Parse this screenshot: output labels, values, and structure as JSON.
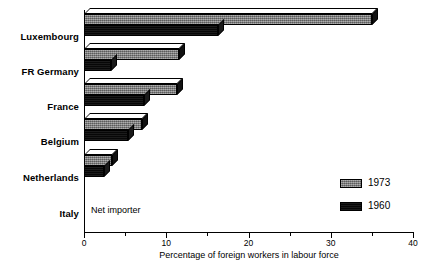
{
  "chart_data": {
    "type": "bar",
    "orientation": "horizontal",
    "title": "",
    "xlabel": "Percentage of foreign workers in labour force",
    "ylabel": "",
    "xlim": [
      0,
      40
    ],
    "grid": false,
    "legend_position": "bottom-right",
    "categories": [
      "Luxembourg",
      "FR Germany",
      "France",
      "Belgium",
      "Netherlands",
      "Italy"
    ],
    "series": [
      {
        "name": "1973",
        "color": "#828282",
        "values": [
          35.0,
          11.5,
          11.3,
          7.0,
          3.4,
          null
        ]
      },
      {
        "name": "1960",
        "color": "#0a0a0a",
        "values": [
          16.3,
          3.3,
          7.3,
          5.3,
          2.4,
          null
        ]
      }
    ],
    "annotations": [
      {
        "category": "Italy",
        "text": "Net importer"
      }
    ],
    "xticks": [
      {
        "value": 0,
        "label": "0",
        "major": true
      },
      {
        "value": 5,
        "label": "",
        "major": false
      },
      {
        "value": 10,
        "label": "10",
        "major": true
      },
      {
        "value": 15,
        "label": "",
        "major": false
      },
      {
        "value": 20,
        "label": "20",
        "major": true
      },
      {
        "value": 25,
        "label": "",
        "major": false
      },
      {
        "value": 30,
        "label": "30",
        "major": true
      },
      {
        "value": 35,
        "label": "",
        "major": false
      },
      {
        "value": 40,
        "label": "40",
        "major": true
      }
    ]
  },
  "legend": {
    "entries": [
      {
        "label": "1973",
        "series": "1973"
      },
      {
        "label": "1960",
        "series": "1960"
      }
    ]
  },
  "axis": {
    "x_title": "Percentage of foreign workers in labour force"
  },
  "labels": {
    "luxembourg": "Luxembourg",
    "fr_germany": "FR Germany",
    "france": "France",
    "belgium": "Belgium",
    "netherlands": "Netherlands",
    "italy": "Italy",
    "net_importer": "Net importer"
  }
}
